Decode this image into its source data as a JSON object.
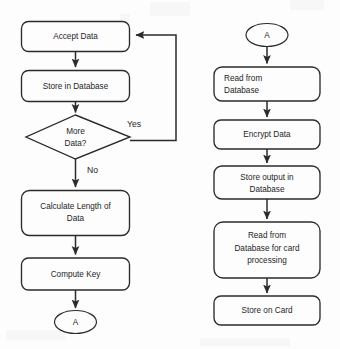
{
  "diagram": {
    "background_color": "#fdfdfd",
    "line_color": "#2b2b2b",
    "text_color": "#1e1e1e"
  },
  "left_column": {
    "nodes": [
      {
        "id": "accept-data",
        "type": "process",
        "label": "Accept Data"
      },
      {
        "id": "store-in-database",
        "type": "process",
        "label": "Store in Database"
      },
      {
        "id": "more-data",
        "type": "decision",
        "label_line1": "More",
        "label_line2": "Data?"
      },
      {
        "id": "calculate-length",
        "type": "process",
        "label_line1": "Calculate Length of",
        "label_line2": "Data"
      },
      {
        "id": "compute-key",
        "type": "process",
        "label": "Compute Key"
      },
      {
        "id": "connector-a-out",
        "type": "connector",
        "label": "A"
      }
    ],
    "edge_labels": {
      "yes": "Yes",
      "no": "No"
    }
  },
  "right_column": {
    "nodes": [
      {
        "id": "connector-a-in",
        "type": "connector",
        "label": "A"
      },
      {
        "id": "read-from-database",
        "type": "process",
        "label_line1": "Read from",
        "label_line2": "Database"
      },
      {
        "id": "encrypt-data",
        "type": "process",
        "label": "Encrypt Data"
      },
      {
        "id": "store-output",
        "type": "process",
        "label_line1": "Store output in",
        "label_line2": "Database"
      },
      {
        "id": "read-for-card",
        "type": "process",
        "label_line1": "Read from",
        "label_line2": "Database for card",
        "label_line3": "processing"
      },
      {
        "id": "store-on-card",
        "type": "process",
        "label": "Store on Card"
      }
    ]
  }
}
